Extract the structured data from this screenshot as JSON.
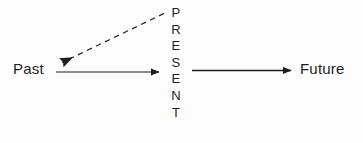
{
  "diagram": {
    "background_color": "#fdfdfd",
    "ink_color": "#1d1d1d",
    "nodes": {
      "past": {
        "label": "Past"
      },
      "present": {
        "label": "PRESENT",
        "orientation": "vertical",
        "letters": [
          "P",
          "R",
          "E",
          "S",
          "E",
          "N",
          "T"
        ]
      },
      "future": {
        "label": "Future"
      }
    },
    "connectors": [
      {
        "name": "present-to-past-dashed-arrow",
        "style": "dashed",
        "from": "present",
        "to": "past",
        "direction": "right-to-left"
      },
      {
        "name": "past-to-present-arrow",
        "style": "solid",
        "from": "past",
        "to": "present",
        "direction": "left-to-right"
      },
      {
        "name": "present-to-future-arrow",
        "style": "solid",
        "from": "present",
        "to": "future",
        "direction": "left-to-right"
      }
    ]
  }
}
